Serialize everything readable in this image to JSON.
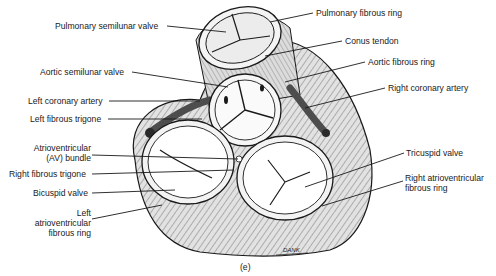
{
  "figure": {
    "caption": "(e)",
    "signature": "DANK",
    "colors": {
      "line": "#1a1a1a",
      "fill": "#d4d4d4",
      "artery": "#555555",
      "valve": "#ffffff"
    }
  },
  "labels": {
    "pulmonary_semilunar_valve": "Pulmonary semilunar valve",
    "aortic_semilunar_valve": "Aortic semilunar valve",
    "left_coronary_artery": "Left coronary artery",
    "left_fibrous_trigone": "Left fibrous trigone",
    "av_bundle_1": "Atrioventricular",
    "av_bundle_2": "(AV) bundle",
    "right_fibrous_trigone": "Right fibrous trigone",
    "bicuspid_valve": "Bicuspid valve",
    "left_av_ring_1": "Left",
    "left_av_ring_2": "atrioventricular",
    "left_av_ring_3": "fibrous ring",
    "pulmonary_fibrous_ring": "Pulmonary fibrous ring",
    "conus_tendon": "Conus tendon",
    "aortic_fibrous_ring": "Aortic fibrous ring",
    "right_coronary_artery": "Right coronary artery",
    "tricuspid_valve": "Tricuspid valve",
    "right_av_ring_1": "Right atrioventricular",
    "right_av_ring_2": "fibrous ring"
  }
}
